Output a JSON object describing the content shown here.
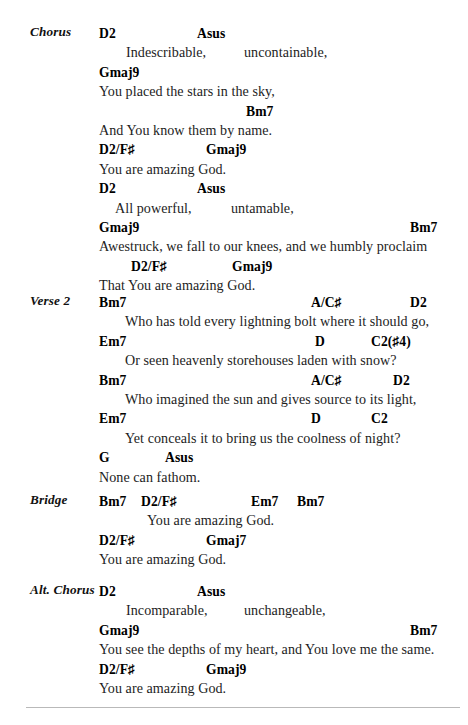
{
  "document": {
    "type": "chord-chart",
    "title_visible": false,
    "divider_present": true
  },
  "sections": [
    {
      "label": "Chorus",
      "top": 24,
      "rows": [
        {
          "kind": "chords",
          "segments": [
            {
              "x": 0,
              "text": "D2"
            },
            {
              "x": 98,
              "text": "Asus"
            }
          ]
        },
        {
          "kind": "lyrics",
          "segments": [
            {
              "x": 27,
              "text": "Indescribable,"
            },
            {
              "x": 145,
              "text": "uncontainable,"
            }
          ]
        },
        {
          "kind": "chords",
          "segments": [
            {
              "x": 0,
              "text": "Gmaj9"
            }
          ]
        },
        {
          "kind": "lyrics",
          "segments": [
            {
              "x": 0,
              "text": "You placed the stars in the sky,"
            }
          ]
        },
        {
          "kind": "chords",
          "segments": [
            {
              "x": 147,
              "text": "Bm7"
            }
          ]
        },
        {
          "kind": "lyrics",
          "segments": [
            {
              "x": 0,
              "text": "And You know them by name."
            }
          ]
        },
        {
          "kind": "chords",
          "segments": [
            {
              "x": 0,
              "text": "D2/F♯"
            },
            {
              "x": 107,
              "text": "Gmaj9"
            }
          ]
        },
        {
          "kind": "lyrics",
          "segments": [
            {
              "x": 0,
              "text": "You are amazing God."
            }
          ]
        },
        {
          "kind": "chords",
          "segments": [
            {
              "x": 0,
              "text": "D2"
            },
            {
              "x": 98,
              "text": "Asus"
            }
          ]
        },
        {
          "kind": "lyrics",
          "segments": [
            {
              "x": 16,
              "text": "All powerful,"
            },
            {
              "x": 132,
              "text": "untamable,"
            }
          ]
        },
        {
          "kind": "chords",
          "segments": [
            {
              "x": 0,
              "text": "Gmaj9"
            },
            {
              "x": 311,
              "text": "Bm7"
            }
          ]
        },
        {
          "kind": "lyrics",
          "segments": [
            {
              "x": 0,
              "text": "Awestruck, we fall to our knees, and we humbly proclaim"
            }
          ]
        },
        {
          "kind": "chords",
          "segments": [
            {
              "x": 32,
              "text": "D2/F♯"
            },
            {
              "x": 133,
              "text": "Gmaj9"
            }
          ]
        },
        {
          "kind": "lyrics",
          "segments": [
            {
              "x": 0,
              "text": "That You are amazing God."
            }
          ]
        }
      ]
    },
    {
      "label": "Verse 2",
      "top": 293,
      "rows": [
        {
          "kind": "chords",
          "segments": [
            {
              "x": 0,
              "text": "Bm7"
            },
            {
              "x": 212,
              "text": "A/C♯"
            },
            {
              "x": 311,
              "text": "D2"
            }
          ]
        },
        {
          "kind": "lyrics",
          "segments": [
            {
              "x": 26,
              "text": "Who has told every lightning bolt where it should go,"
            }
          ]
        },
        {
          "kind": "chords",
          "segments": [
            {
              "x": 0,
              "text": "Em7"
            },
            {
              "x": 216,
              "text": "D"
            },
            {
              "x": 272,
              "text": "C2(♯4)"
            }
          ]
        },
        {
          "kind": "lyrics",
          "segments": [
            {
              "x": 26,
              "text": "Or seen heavenly storehouses laden with snow?"
            }
          ]
        },
        {
          "kind": "chords",
          "segments": [
            {
              "x": 0,
              "text": "Bm7"
            },
            {
              "x": 212,
              "text": "A/C♯"
            },
            {
              "x": 294,
              "text": "D2"
            }
          ]
        },
        {
          "kind": "lyrics",
          "segments": [
            {
              "x": 26,
              "text": "Who imagined the sun and gives source to its light,"
            }
          ]
        },
        {
          "kind": "chords",
          "segments": [
            {
              "x": 0,
              "text": "Em7"
            },
            {
              "x": 212,
              "text": "D"
            },
            {
              "x": 272,
              "text": "C2"
            }
          ]
        },
        {
          "kind": "lyrics",
          "segments": [
            {
              "x": 26,
              "text": "Yet conceals it to bring us the coolness of night?"
            }
          ]
        },
        {
          "kind": "chords",
          "segments": [
            {
              "x": 0,
              "text": "G"
            },
            {
              "x": 66,
              "text": "Asus"
            }
          ]
        },
        {
          "kind": "lyrics",
          "segments": [
            {
              "x": 0,
              "text": "None can fathom."
            }
          ]
        }
      ]
    },
    {
      "label": "Bridge",
      "top": 492,
      "rows": [
        {
          "kind": "chords",
          "segments": [
            {
              "x": 0,
              "text": "Bm7"
            },
            {
              "x": 42,
              "text": "D2/F♯"
            },
            {
              "x": 152,
              "text": "Em7"
            },
            {
              "x": 198,
              "text": "Bm7"
            }
          ]
        },
        {
          "kind": "lyrics",
          "segments": [
            {
              "x": 48,
              "text": "You are amazing God."
            }
          ]
        },
        {
          "kind": "chords",
          "segments": [
            {
              "x": 0,
              "text": "D2/F♯"
            },
            {
              "x": 107,
              "text": "Gmaj7"
            }
          ]
        },
        {
          "kind": "lyrics",
          "segments": [
            {
              "x": 0,
              "text": "You are amazing God."
            }
          ]
        }
      ]
    },
    {
      "label": "Alt. Chorus",
      "top": 582,
      "rows": [
        {
          "kind": "chords",
          "segments": [
            {
              "x": 0,
              "text": "D2"
            },
            {
              "x": 98,
              "text": "Asus"
            }
          ]
        },
        {
          "kind": "lyrics",
          "segments": [
            {
              "x": 27,
              "text": "Incomparable,"
            },
            {
              "x": 145,
              "text": "unchangeable,"
            }
          ]
        },
        {
          "kind": "chords",
          "segments": [
            {
              "x": 0,
              "text": "Gmaj9"
            },
            {
              "x": 311,
              "text": "Bm7"
            }
          ]
        },
        {
          "kind": "lyrics",
          "segments": [
            {
              "x": 0,
              "text": "You see the depths of my heart, and You love me the same."
            }
          ]
        },
        {
          "kind": "chords",
          "segments": [
            {
              "x": 0,
              "text": "D2/F♯"
            },
            {
              "x": 107,
              "text": "Gmaj9"
            }
          ]
        },
        {
          "kind": "lyrics",
          "segments": [
            {
              "x": 0,
              "text": "You are amazing God."
            }
          ]
        }
      ]
    }
  ]
}
